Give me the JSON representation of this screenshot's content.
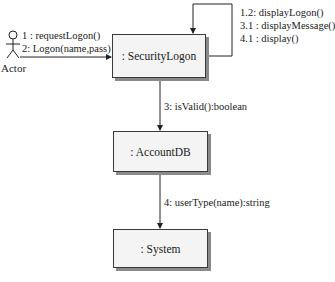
{
  "diagram": {
    "type": "UML collaboration diagram",
    "actor": {
      "label": "Actor"
    },
    "objects": [
      {
        "id": "securitylogon",
        "label": ": SecurityLogon"
      },
      {
        "id": "accountdb",
        "label": ": AccountDB"
      },
      {
        "id": "system",
        "label": ": System"
      }
    ],
    "messages": {
      "actor_to_securitylogon": [
        "1 : requestLogon()",
        "2: Logon(name,pass)"
      ],
      "self_loop": [
        "1.2: displayLogon()",
        "3.1 : displayMessage()",
        "4.1 : display()"
      ],
      "securitylogon_to_accountdb": "3: isValid():boolean",
      "accountdb_to_system": "4: userType(name):string"
    }
  }
}
